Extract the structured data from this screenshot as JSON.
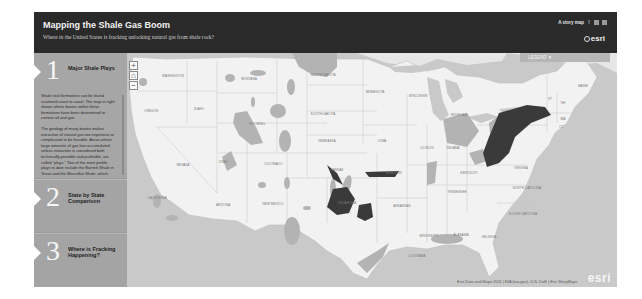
{
  "header": {
    "title": "Mapping the Shale Gas Boom",
    "subtitle": "Where in the United States is fracking unlocking natural gas from shale rock?",
    "story_map_label": "A story map",
    "social_icons": [
      "facebook-icon",
      "twitter-icon",
      "link-icon"
    ],
    "logo": "esri"
  },
  "sidebar": {
    "sections": [
      {
        "number": "1",
        "title": "Major Shale Plays",
        "active": true,
        "paragraphs": [
          "Shale rock formations can be found scattered coast to coast. The map at right shows where basins within these formations have been determined to contain oil and gas.",
          "The geology of many basins makes extraction of natural gas too expensive or complicated to be feasible. Areas where large amounts of gas has accumulated unless extraction is considered both technically possible and profitable, are called \"plays.\" Two of the most prolific plays to date include the Barnett Shale in Texas and the Marcellus Shale, which"
        ]
      },
      {
        "number": "2",
        "title": "State by State Comparison",
        "active": false
      },
      {
        "number": "3",
        "title": "Where is Fracking Happening?",
        "active": false
      }
    ]
  },
  "map": {
    "legend_label": "LEGEND ▼",
    "zoom_in": "+",
    "home": "⌂",
    "zoom_out": "−",
    "attribution": "Esri Data and Maps 2011 | EIA (eia.gov), U.S. DoE | Esri StoryMaps",
    "watermark": "esri",
    "state_labels": [
      {
        "name": "WASHINGTON",
        "x": 46,
        "y": 24
      },
      {
        "name": "OREGON",
        "x": 24,
        "y": 59
      },
      {
        "name": "IDAHO",
        "x": 72,
        "y": 57
      },
      {
        "name": "MONTANA",
        "x": 122,
        "y": 27
      },
      {
        "name": "WYOMING",
        "x": 130,
        "y": 72
      },
      {
        "name": "NEVADA",
        "x": 56,
        "y": 113
      },
      {
        "name": "UTAH",
        "x": 96,
        "y": 110
      },
      {
        "name": "COLORADO",
        "x": 146,
        "y": 112
      },
      {
        "name": "CALIFORNIA",
        "x": 30,
        "y": 146
      },
      {
        "name": "ARIZONA",
        "x": 96,
        "y": 153
      },
      {
        "name": "NEW MEXICO",
        "x": 146,
        "y": 152
      },
      {
        "name": "NORTH DAKOTA",
        "x": 196,
        "y": 23
      },
      {
        "name": "SOUTH DAKOTA",
        "x": 196,
        "y": 62
      },
      {
        "name": "NEBRASKA",
        "x": 200,
        "y": 89
      },
      {
        "name": "KANSAS",
        "x": 210,
        "y": 118
      },
      {
        "name": "OKLAHOMA",
        "x": 220,
        "y": 151
      },
      {
        "name": "TEXAS",
        "x": 200,
        "y": 186
      },
      {
        "name": "MINNESOTA",
        "x": 248,
        "y": 40
      },
      {
        "name": "IOWA",
        "x": 255,
        "y": 89
      },
      {
        "name": "MISSOURI",
        "x": 267,
        "y": 121
      },
      {
        "name": "ARKANSAS",
        "x": 275,
        "y": 154
      },
      {
        "name": "LOUISIANA",
        "x": 290,
        "y": 204
      },
      {
        "name": "WISCONSIN",
        "x": 291,
        "y": 44
      },
      {
        "name": "MICHIGAN",
        "x": 332,
        "y": 63
      },
      {
        "name": "ILLINOIS",
        "x": 300,
        "y": 96
      },
      {
        "name": "INDIANA",
        "x": 326,
        "y": 96
      },
      {
        "name": "OHIO",
        "x": 350,
        "y": 92
      },
      {
        "name": "KENTUCKY",
        "x": 342,
        "y": 121
      },
      {
        "name": "TENNESSEE",
        "x": 330,
        "y": 140
      },
      {
        "name": "MISSISSIPPI",
        "x": 302,
        "y": 184
      },
      {
        "name": "ALABAMA",
        "x": 334,
        "y": 183
      },
      {
        "name": "GEORGIA",
        "x": 362,
        "y": 185
      },
      {
        "name": "NORTH CAROLINA",
        "x": 400,
        "y": 136
      },
      {
        "name": "SOUTH CAROLINA",
        "x": 396,
        "y": 162
      },
      {
        "name": "VIRGINIA",
        "x": 394,
        "y": 116
      },
      {
        "name": "MAINE",
        "x": 456,
        "y": 34
      },
      {
        "name": "VT",
        "x": 423,
        "y": 47
      },
      {
        "name": "NH",
        "x": 436,
        "y": 51
      },
      {
        "name": "MA",
        "x": 436,
        "y": 67
      },
      {
        "name": "CT",
        "x": 434,
        "y": 75
      },
      {
        "name": "NY",
        "x": 400,
        "y": 64
      }
    ]
  },
  "colors": {
    "header_bg": "#2a2a2a",
    "sidebar_bg": "#a6a6a6",
    "land": "#f0f0f0",
    "water": "#c8c8c8",
    "basin": "#b0b0b0",
    "play": "#3a3a3a"
  }
}
